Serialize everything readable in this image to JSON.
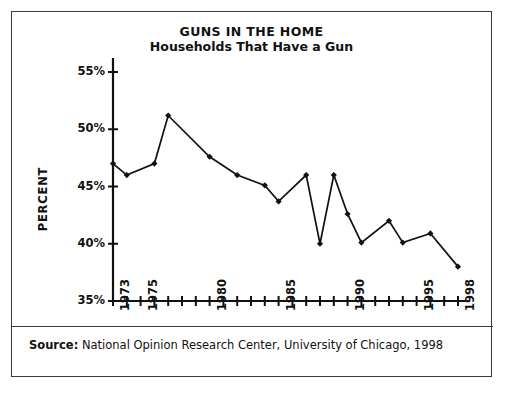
{
  "chart_data": {
    "type": "line",
    "title": "GUNS IN THE HOME",
    "subtitle": "Households That Have a Gun",
    "xlabel": "",
    "ylabel": "PERCENT",
    "ylim": [
      35,
      55
    ],
    "ytick_values": [
      35,
      40,
      45,
      50,
      55
    ],
    "ytick_labels": [
      "35%",
      "40%",
      "45%",
      "50%",
      "55%"
    ],
    "xlim": [
      1973,
      1998
    ],
    "xtick_values": [
      1973,
      1974,
      1975,
      1976,
      1977,
      1978,
      1979,
      1980,
      1981,
      1982,
      1983,
      1984,
      1985,
      1986,
      1987,
      1988,
      1989,
      1990,
      1991,
      1992,
      1993,
      1994,
      1995,
      1996,
      1997,
      1998
    ],
    "xtick_labeled": [
      1973,
      1975,
      1980,
      1985,
      1990,
      1995,
      1998
    ],
    "xtick_labels": [
      "1973",
      "1975",
      "1980",
      "1985",
      "1990",
      "1995",
      "1998"
    ],
    "grid": false,
    "legend": null,
    "line_color": "#111111",
    "marker": "diamond",
    "x": [
      1973,
      1974,
      1976,
      1977,
      1980,
      1982,
      1984,
      1985,
      1987,
      1988,
      1989,
      1990,
      1991,
      1993,
      1994,
      1996,
      1998
    ],
    "values": [
      47.0,
      46.0,
      47.0,
      51.2,
      47.6,
      46.0,
      45.1,
      43.7,
      46.0,
      40.0,
      46.0,
      42.6,
      40.1,
      42.0,
      40.1,
      40.9,
      38.0
    ],
    "points": [
      {
        "year": 1973,
        "percent": 47.0
      },
      {
        "year": 1974,
        "percent": 46.0
      },
      {
        "year": 1976,
        "percent": 47.0
      },
      {
        "year": 1977,
        "percent": 51.2
      },
      {
        "year": 1980,
        "percent": 47.6
      },
      {
        "year": 1982,
        "percent": 46.0
      },
      {
        "year": 1984,
        "percent": 45.1
      },
      {
        "year": 1985,
        "percent": 43.7
      },
      {
        "year": 1987,
        "percent": 46.0
      },
      {
        "year": 1988,
        "percent": 40.0
      },
      {
        "year": 1989,
        "percent": 46.0
      },
      {
        "year": 1990,
        "percent": 42.6
      },
      {
        "year": 1991,
        "percent": 40.1
      },
      {
        "year": 1993,
        "percent": 42.0
      },
      {
        "year": 1994,
        "percent": 40.1
      },
      {
        "year": 1996,
        "percent": 40.9
      },
      {
        "year": 1998,
        "percent": 38.0
      }
    ]
  },
  "source": {
    "label": "Source:",
    "text": "National Opinion Research Center, University of Chicago, 1998"
  },
  "colors": {
    "border": "#3a3a3a",
    "axis": "#111111",
    "line": "#111111",
    "background": "#ffffff"
  }
}
